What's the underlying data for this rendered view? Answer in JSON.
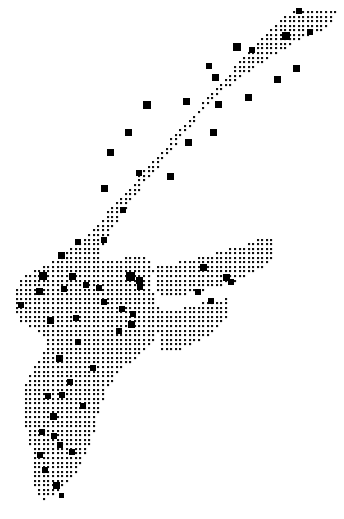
{
  "figure": {
    "name": "dot-grid-map",
    "type": "dot-density-map",
    "background_color": "#ffffff",
    "ink_color": "#000000",
    "width": 344,
    "height": 519,
    "title": "",
    "subtitle": "",
    "caption": "",
    "legend": [],
    "axis_labels": [],
    "annotations": []
  },
  "chart_data": {
    "type": "scatter",
    "title": "",
    "xlabel": "",
    "ylabel": "",
    "xlim": [
      0,
      344
    ],
    "ylim": [
      0,
      519
    ],
    "grid": false,
    "legend_position": "none",
    "grid_dots": {
      "pitch_x": 4.55,
      "pitch_y": 4.55,
      "dot_size": 2.1,
      "origin_x": 3.0,
      "origin_y": 3.0,
      "color": "#111111",
      "shape": "square",
      "region_polygons": [
        [
          [
            299,
            8
          ],
          [
            336,
            12
          ],
          [
            330,
            27
          ],
          [
            300,
            40
          ],
          [
            280,
            52
          ],
          [
            253,
            68
          ],
          [
            232,
            84
          ],
          [
            214,
            100
          ],
          [
            199,
            116
          ],
          [
            186,
            132
          ],
          [
            173,
            148
          ],
          [
            160,
            164
          ],
          [
            146,
            182
          ],
          [
            132,
            200
          ],
          [
            120,
            217
          ],
          [
            110,
            233
          ],
          [
            103,
            248
          ],
          [
            98,
            260
          ],
          [
            106,
            262
          ],
          [
            120,
            258
          ],
          [
            134,
            256
          ],
          [
            146,
            258
          ],
          [
            152,
            268
          ],
          [
            152,
            286
          ],
          [
            156,
            300
          ],
          [
            160,
            312
          ],
          [
            160,
            330
          ],
          [
            152,
            344
          ],
          [
            140,
            356
          ],
          [
            126,
            366
          ],
          [
            114,
            378
          ],
          [
            106,
            392
          ],
          [
            100,
            408
          ],
          [
            96,
            424
          ],
          [
            92,
            440
          ],
          [
            86,
            456
          ],
          [
            78,
            470
          ],
          [
            68,
            482
          ],
          [
            58,
            492
          ],
          [
            46,
            500
          ],
          [
            38,
            498
          ],
          [
            34,
            486
          ],
          [
            34,
            470
          ],
          [
            32,
            452
          ],
          [
            28,
            436
          ],
          [
            24,
            420
          ],
          [
            22,
            404
          ],
          [
            24,
            388
          ],
          [
            30,
            374
          ],
          [
            38,
            362
          ],
          [
            44,
            350
          ],
          [
            44,
            338
          ],
          [
            38,
            330
          ],
          [
            28,
            326
          ],
          [
            18,
            320
          ],
          [
            13,
            308
          ],
          [
            13,
            294
          ],
          [
            18,
            282
          ],
          [
            28,
            274
          ],
          [
            40,
            268
          ],
          [
            52,
            262
          ],
          [
            64,
            254
          ],
          [
            78,
            242
          ],
          [
            92,
            228
          ],
          [
            106,
            214
          ],
          [
            120,
            198
          ],
          [
            134,
            182
          ],
          [
            148,
            166
          ],
          [
            162,
            150
          ],
          [
            176,
            134
          ],
          [
            190,
            118
          ],
          [
            204,
            102
          ],
          [
            218,
            86
          ],
          [
            232,
            70
          ],
          [
            246,
            54
          ],
          [
            260,
            40
          ],
          [
            274,
            26
          ],
          [
            288,
            14
          ]
        ],
        [
          [
            152,
            268
          ],
          [
            178,
            262
          ],
          [
            204,
            256
          ],
          [
            226,
            250
          ],
          [
            246,
            244
          ],
          [
            262,
            238
          ],
          [
            272,
            236
          ],
          [
            276,
            246
          ],
          [
            272,
            258
          ],
          [
            262,
            268
          ],
          [
            248,
            276
          ],
          [
            232,
            282
          ],
          [
            214,
            288
          ],
          [
            196,
            292
          ],
          [
            178,
            296
          ],
          [
            164,
            298
          ],
          [
            156,
            292
          ]
        ],
        [
          [
            160,
            312
          ],
          [
            180,
            308
          ],
          [
            198,
            304
          ],
          [
            214,
            300
          ],
          [
            226,
            298
          ],
          [
            230,
            306
          ],
          [
            226,
            318
          ],
          [
            216,
            330
          ],
          [
            202,
            340
          ],
          [
            186,
            348
          ],
          [
            172,
            352
          ],
          [
            162,
            350
          ],
          [
            158,
            338
          ],
          [
            158,
            324
          ]
        ]
      ]
    },
    "point_markers": {
      "shape": "square",
      "color": "#000000",
      "count": 62,
      "size_range": [
        5,
        9
      ],
      "points": [
        {
          "x": 299,
          "y": 11,
          "size": 6
        },
        {
          "x": 286,
          "y": 36,
          "size": 8
        },
        {
          "x": 310,
          "y": 32,
          "size": 6
        },
        {
          "x": 237,
          "y": 47,
          "size": 8
        },
        {
          "x": 252,
          "y": 50,
          "size": 6
        },
        {
          "x": 296,
          "y": 68,
          "size": 7
        },
        {
          "x": 277,
          "y": 79,
          "size": 7
        },
        {
          "x": 209,
          "y": 66,
          "size": 6
        },
        {
          "x": 215,
          "y": 77,
          "size": 7
        },
        {
          "x": 147,
          "y": 105,
          "size": 8
        },
        {
          "x": 186,
          "y": 101,
          "size": 7
        },
        {
          "x": 218,
          "y": 104,
          "size": 7
        },
        {
          "x": 248,
          "y": 97,
          "size": 7
        },
        {
          "x": 128,
          "y": 132,
          "size": 7
        },
        {
          "x": 110,
          "y": 152,
          "size": 7
        },
        {
          "x": 188,
          "y": 142,
          "size": 7
        },
        {
          "x": 213,
          "y": 132,
          "size": 7
        },
        {
          "x": 104,
          "y": 188,
          "size": 7
        },
        {
          "x": 123,
          "y": 210,
          "size": 6
        },
        {
          "x": 170,
          "y": 176,
          "size": 7
        },
        {
          "x": 139,
          "y": 173,
          "size": 6
        },
        {
          "x": 104,
          "y": 240,
          "size": 6
        },
        {
          "x": 78,
          "y": 242,
          "size": 6
        },
        {
          "x": 61,
          "y": 255,
          "size": 7
        },
        {
          "x": 43,
          "y": 276,
          "size": 8
        },
        {
          "x": 72,
          "y": 276,
          "size": 7
        },
        {
          "x": 39,
          "y": 291,
          "size": 7
        },
        {
          "x": 64,
          "y": 289,
          "size": 6
        },
        {
          "x": 86,
          "y": 285,
          "size": 6
        },
        {
          "x": 21,
          "y": 305,
          "size": 6
        },
        {
          "x": 50,
          "y": 320,
          "size": 7
        },
        {
          "x": 76,
          "y": 318,
          "size": 6
        },
        {
          "x": 104,
          "y": 302,
          "size": 6
        },
        {
          "x": 130,
          "y": 276,
          "size": 9
        },
        {
          "x": 139,
          "y": 280,
          "size": 7
        },
        {
          "x": 99,
          "y": 288,
          "size": 6
        },
        {
          "x": 122,
          "y": 309,
          "size": 6
        },
        {
          "x": 131,
          "y": 324,
          "size": 7
        },
        {
          "x": 119,
          "y": 331,
          "size": 6
        },
        {
          "x": 140,
          "y": 287,
          "size": 6
        },
        {
          "x": 203,
          "y": 267,
          "size": 7
        },
        {
          "x": 226,
          "y": 277,
          "size": 7
        },
        {
          "x": 231,
          "y": 282,
          "size": 6
        },
        {
          "x": 198,
          "y": 292,
          "size": 6
        },
        {
          "x": 211,
          "y": 301,
          "size": 6
        },
        {
          "x": 133,
          "y": 314,
          "size": 6
        },
        {
          "x": 78,
          "y": 342,
          "size": 6
        },
        {
          "x": 59,
          "y": 358,
          "size": 7
        },
        {
          "x": 93,
          "y": 368,
          "size": 6
        },
        {
          "x": 70,
          "y": 382,
          "size": 6
        },
        {
          "x": 48,
          "y": 396,
          "size": 6
        },
        {
          "x": 62,
          "y": 395,
          "size": 6
        },
        {
          "x": 83,
          "y": 406,
          "size": 6
        },
        {
          "x": 53,
          "y": 416,
          "size": 7
        },
        {
          "x": 42,
          "y": 432,
          "size": 6
        },
        {
          "x": 54,
          "y": 436,
          "size": 6
        },
        {
          "x": 60,
          "y": 445,
          "size": 6
        },
        {
          "x": 40,
          "y": 455,
          "size": 6
        },
        {
          "x": 72,
          "y": 452,
          "size": 6
        },
        {
          "x": 45,
          "y": 470,
          "size": 6
        },
        {
          "x": 56,
          "y": 485,
          "size": 7
        },
        {
          "x": 61,
          "y": 495,
          "size": 5
        }
      ]
    }
  }
}
